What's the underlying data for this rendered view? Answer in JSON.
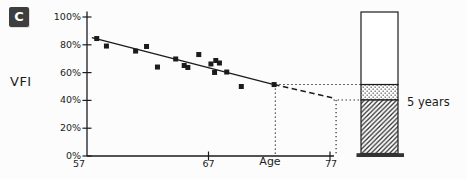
{
  "panel": {
    "label": "C"
  },
  "colors": {
    "ink": "#1b1b1b",
    "badge_bg": "#3e3e3e",
    "badge_text": "#ffffff",
    "background": "#fcfcfc",
    "pedestal": "#333333"
  },
  "chart_data": {
    "type": "scatter",
    "title": "",
    "xlabel": "Age",
    "ylabel": "VFI",
    "xlim": [
      57,
      77
    ],
    "ylim": [
      0,
      100
    ],
    "x_ticks": [
      57,
      67,
      77
    ],
    "y_ticks": [
      0,
      20,
      40,
      60,
      80,
      100
    ],
    "y_tick_suffix": "%",
    "grid": false,
    "points": [
      [
        57.8,
        84.5
      ],
      [
        58.6,
        79.1
      ],
      [
        61.0,
        75.5
      ],
      [
        61.9,
        78.8
      ],
      [
        62.8,
        64.0
      ],
      [
        64.3,
        69.8
      ],
      [
        65.0,
        65.1
      ],
      [
        65.3,
        63.7
      ],
      [
        66.2,
        73.0
      ],
      [
        67.2,
        66.2
      ],
      [
        67.6,
        68.7
      ],
      [
        67.9,
        66.9
      ],
      [
        67.5,
        60.1
      ],
      [
        68.5,
        60.4
      ],
      [
        69.7,
        50.0
      ],
      [
        72.4,
        51.4
      ]
    ],
    "trend": {
      "solid": [
        [
          57.4,
          85.2
        ],
        [
          72.4,
          51.4
        ]
      ],
      "dashed": [
        [
          72.4,
          51.4
        ],
        [
          77.3,
          41.7
        ]
      ]
    },
    "reference": {
      "current": {
        "age": 72.5,
        "vfi": 51.4
      },
      "projected": {
        "age": 77.5,
        "vfi": 40.3
      }
    },
    "bar": {
      "label": "5 years",
      "sections": [
        {
          "name": "remaining",
          "style": "empty",
          "from_pct": 51.4,
          "to_pct": 100
        },
        {
          "name": "projected-loss",
          "style": "dots",
          "from_pct": 40.3,
          "to_pct": 51.4
        },
        {
          "name": "defect",
          "style": "hatch",
          "from_pct": 0,
          "to_pct": 40.3
        }
      ]
    }
  }
}
